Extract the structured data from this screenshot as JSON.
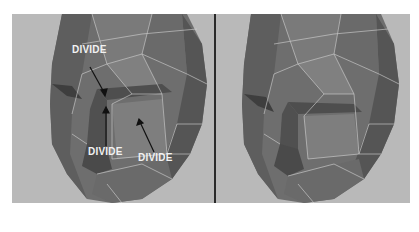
{
  "figure": {
    "panels": [
      {
        "id": "before",
        "description": "low-poly head mesh with annotations"
      },
      {
        "id": "after",
        "description": "low-poly head mesh after divide"
      }
    ],
    "annotations": [
      {
        "text": "DIVIDE",
        "x": 72,
        "y": 44
      },
      {
        "text": "DIVIDE",
        "x": 88,
        "y": 146
      },
      {
        "text": "DIVIDE",
        "x": 139,
        "y": 152
      }
    ]
  },
  "colors": {
    "background": "#ffffff",
    "viewport": "#b9b9b9",
    "mesh_dark": "#5c5c5c",
    "mesh_mid": "#777777",
    "mesh_light": "#8a8a8a",
    "wire": "#d8d8d8",
    "divider": "#2a2a2a",
    "label": "#f2f2f2"
  }
}
